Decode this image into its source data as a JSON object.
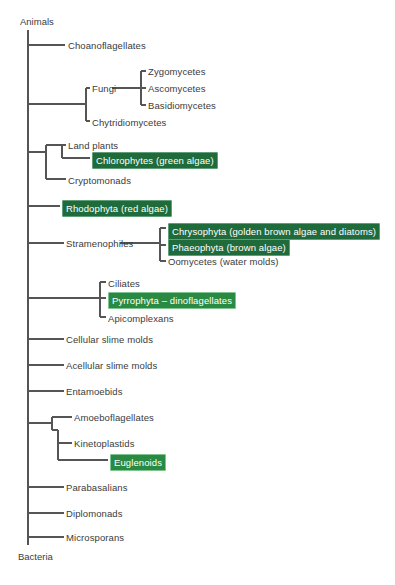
{
  "diagram": {
    "root_top_label": "Animals",
    "root_bottom_label": "Bacteria",
    "line_color": "#555555",
    "text_color": "#3b3b3b",
    "highlight_dark_color": "#1f6b3c",
    "highlight_bright_color": "#2a8a43",
    "highlight_border_color": "#7ec48f",
    "highlight_text_color": "#ffffff",
    "background_color": "#ffffff"
  },
  "taxa": [
    {
      "id": "choanoflagellates",
      "label": "Choanoflagellates",
      "highlight": "none",
      "x": 68,
      "y": 40
    },
    {
      "id": "zygomycetes",
      "label": "Zygomycetes",
      "highlight": "none",
      "x": 148,
      "y": 66
    },
    {
      "id": "ascomycetes",
      "label": "Ascomycetes",
      "highlight": "none",
      "x": 148,
      "y": 83
    },
    {
      "id": "basidiomycetes",
      "label": "Basidiomycetes",
      "highlight": "none",
      "x": 148,
      "y": 100
    },
    {
      "id": "fungi",
      "label": "Fungi",
      "highlight": "none",
      "x": 92,
      "y": 83
    },
    {
      "id": "chytridiomycetes",
      "label": "Chytridiomycetes",
      "highlight": "none",
      "x": 92,
      "y": 117
    },
    {
      "id": "land-plants",
      "label": "Land plants",
      "highlight": "none",
      "x": 68,
      "y": 140
    },
    {
      "id": "chlorophytes",
      "label": "Chlorophytes (green algae)",
      "highlight": "dark",
      "x": 92,
      "y": 152
    },
    {
      "id": "cryptomonads",
      "label": "Cryptomonads",
      "highlight": "none",
      "x": 68,
      "y": 175
    },
    {
      "id": "rhodophyta",
      "label": "Rhodophyta (red algae)",
      "highlight": "dark",
      "x": 62,
      "y": 200
    },
    {
      "id": "chrysophyta",
      "label": "Chrysophyta (golden brown algae and diatoms)",
      "highlight": "dark",
      "x": 168,
      "y": 223
    },
    {
      "id": "phaeophyta",
      "label": "Phaeophyta (brown algae)",
      "highlight": "dark",
      "x": 168,
      "y": 239
    },
    {
      "id": "oomycetes",
      "label": "Oomycetes (water molds)",
      "highlight": "none",
      "x": 168,
      "y": 256
    },
    {
      "id": "stramenophiles",
      "label": "Stramenophiles",
      "highlight": "none",
      "x": 66,
      "y": 238
    },
    {
      "id": "ciliates",
      "label": "Ciliates",
      "highlight": "none",
      "x": 108,
      "y": 278
    },
    {
      "id": "pyrrophyta",
      "label": "Pyrrophyta – dinoflagellates",
      "highlight": "bright",
      "x": 108,
      "y": 292
    },
    {
      "id": "apicomplexans",
      "label": "Apicomplexans",
      "highlight": "none",
      "x": 108,
      "y": 313
    },
    {
      "id": "cellular-slime",
      "label": "Cellular slime molds",
      "highlight": "none",
      "x": 66,
      "y": 334
    },
    {
      "id": "acellular-slime",
      "label": "Acellular slime molds",
      "highlight": "none",
      "x": 66,
      "y": 360
    },
    {
      "id": "entamoebids",
      "label": "Entamoebids",
      "highlight": "none",
      "x": 66,
      "y": 386
    },
    {
      "id": "amoeboflagellates",
      "label": "Amoeboflagellates",
      "highlight": "none",
      "x": 74,
      "y": 412
    },
    {
      "id": "kinetoplastids",
      "label": "Kinetoplastids",
      "highlight": "none",
      "x": 74,
      "y": 438
    },
    {
      "id": "euglenoids",
      "label": "Euglenoids",
      "highlight": "bright",
      "x": 110,
      "y": 454
    },
    {
      "id": "parabasalians",
      "label": "Parabasalians",
      "highlight": "none",
      "x": 66,
      "y": 482
    },
    {
      "id": "diplomonads",
      "label": "Diplomonads",
      "highlight": "none",
      "x": 66,
      "y": 508
    },
    {
      "id": "microsporans",
      "label": "Microsporans",
      "highlight": "none",
      "x": 66,
      "y": 532
    }
  ],
  "edges": {
    "trunk": {
      "x": 28,
      "y1": 30,
      "y2": 545
    },
    "branches": [
      {
        "id": "branch-choanoflagellates",
        "x1": 28,
        "y1": 45,
        "x2": 65,
        "y2": 45
      },
      {
        "id": "branch-fungi-clade-stem",
        "x1": 28,
        "y1": 104,
        "x2": 86,
        "y2": 104
      },
      {
        "id": "branch-fungi-node",
        "x1": 86,
        "y1": 88,
        "x2": 86,
        "y2": 121
      },
      {
        "id": "branch-fungi-tip",
        "x1": 86,
        "y1": 88,
        "x2": 90,
        "y2": 88
      },
      {
        "id": "branch-chytrid-tip",
        "x1": 86,
        "y1": 121,
        "x2": 90,
        "y2": 121
      },
      {
        "id": "branch-fungi-sub-stem",
        "x1": 112,
        "y1": 88,
        "x2": 141,
        "y2": 88
      },
      {
        "id": "branch-fungi-sub-node",
        "x1": 141,
        "y1": 71,
        "x2": 141,
        "y2": 105
      },
      {
        "id": "branch-zygo-tip",
        "x1": 141,
        "y1": 71,
        "x2": 146,
        "y2": 71
      },
      {
        "id": "branch-asco-tip",
        "x1": 141,
        "y1": 88,
        "x2": 146,
        "y2": 88
      },
      {
        "id": "branch-basidio-tip",
        "x1": 141,
        "y1": 105,
        "x2": 146,
        "y2": 105
      },
      {
        "id": "branch-plants-stem",
        "x1": 28,
        "y1": 152,
        "x2": 46,
        "y2": 152
      },
      {
        "id": "branch-plants-node",
        "x1": 46,
        "y1": 145,
        "x2": 46,
        "y2": 179
      },
      {
        "id": "branch-crypto-tip",
        "x1": 46,
        "y1": 179,
        "x2": 66,
        "y2": 179
      },
      {
        "id": "branch-plants-inner-stem",
        "x1": 46,
        "y1": 145,
        "x2": 62,
        "y2": 145
      },
      {
        "id": "branch-plants-inner-node",
        "x1": 62,
        "y1": 145,
        "x2": 62,
        "y2": 158
      },
      {
        "id": "branch-landplants-tip",
        "x1": 62,
        "y1": 145,
        "x2": 66,
        "y2": 145
      },
      {
        "id": "branch-chlorophytes-tip",
        "x1": 62,
        "y1": 158,
        "x2": 90,
        "y2": 158
      },
      {
        "id": "branch-rhodophyta",
        "x1": 28,
        "y1": 206,
        "x2": 60,
        "y2": 206
      },
      {
        "id": "branch-stramen-stem",
        "x1": 28,
        "y1": 243,
        "x2": 64,
        "y2": 243
      },
      {
        "id": "branch-stramen-post",
        "x1": 120,
        "y1": 243,
        "x2": 160,
        "y2": 243
      },
      {
        "id": "branch-stramen-node",
        "x1": 160,
        "y1": 228,
        "x2": 160,
        "y2": 261
      },
      {
        "id": "branch-chryso-tip",
        "x1": 160,
        "y1": 228,
        "x2": 166,
        "y2": 228
      },
      {
        "id": "branch-phaeo-tip",
        "x1": 160,
        "y1": 245,
        "x2": 166,
        "y2": 245
      },
      {
        "id": "branch-oomycetes-tip",
        "x1": 160,
        "y1": 261,
        "x2": 166,
        "y2": 261
      },
      {
        "id": "branch-alveolata-stem",
        "x1": 28,
        "y1": 298,
        "x2": 100,
        "y2": 298
      },
      {
        "id": "branch-alveolata-node",
        "x1": 100,
        "y1": 282,
        "x2": 100,
        "y2": 317
      },
      {
        "id": "branch-ciliates-tip",
        "x1": 100,
        "y1": 282,
        "x2": 106,
        "y2": 282
      },
      {
        "id": "branch-pyrrophyta-tip",
        "x1": 100,
        "y1": 298,
        "x2": 106,
        "y2": 298
      },
      {
        "id": "branch-apicomplexa-tip",
        "x1": 100,
        "y1": 317,
        "x2": 106,
        "y2": 317
      },
      {
        "id": "branch-cellular-slime",
        "x1": 28,
        "y1": 339,
        "x2": 64,
        "y2": 339
      },
      {
        "id": "branch-acellular-slime",
        "x1": 28,
        "y1": 365,
        "x2": 64,
        "y2": 365
      },
      {
        "id": "branch-entamoebids",
        "x1": 28,
        "y1": 391,
        "x2": 64,
        "y2": 391
      },
      {
        "id": "branch-euglenozoa-stem",
        "x1": 28,
        "y1": 423,
        "x2": 52,
        "y2": 423
      },
      {
        "id": "branch-euglenozoa-node",
        "x1": 52,
        "y1": 417,
        "x2": 52,
        "y2": 430
      },
      {
        "id": "branch-amoebofl-tip",
        "x1": 52,
        "y1": 417,
        "x2": 72,
        "y2": 417
      },
      {
        "id": "branch-euglenozoa-inner",
        "x1": 52,
        "y1": 430,
        "x2": 58,
        "y2": 430
      },
      {
        "id": "branch-kineto-node",
        "x1": 58,
        "y1": 430,
        "x2": 58,
        "y2": 460
      },
      {
        "id": "branch-kineto-tip",
        "x1": 58,
        "y1": 443,
        "x2": 72,
        "y2": 443
      },
      {
        "id": "branch-euglenoids-tip",
        "x1": 58,
        "y1": 460,
        "x2": 108,
        "y2": 460
      },
      {
        "id": "branch-parabasalians",
        "x1": 28,
        "y1": 487,
        "x2": 64,
        "y2": 487
      },
      {
        "id": "branch-diplomonads",
        "x1": 28,
        "y1": 513,
        "x2": 64,
        "y2": 513
      },
      {
        "id": "branch-microsporans",
        "x1": 28,
        "y1": 537,
        "x2": 64,
        "y2": 537
      }
    ]
  },
  "root_labels": {
    "top": {
      "text": "Animals",
      "x": 20,
      "y": 16
    },
    "bottom": {
      "text": "Bacteria",
      "x": 18,
      "y": 551
    }
  }
}
